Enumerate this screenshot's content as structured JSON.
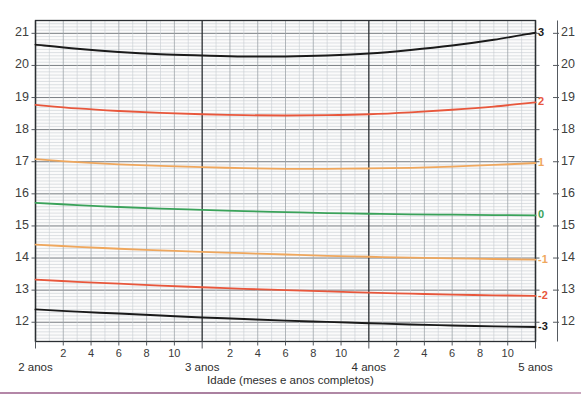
{
  "chart_data": {
    "type": "line",
    "title": "",
    "subtitle": "",
    "xlabel": "Idade (meses e anos completos)",
    "ylabel": "",
    "ylabel_right": "",
    "xlim": [
      24,
      60
    ],
    "ylim": [
      11.4,
      21.4
    ],
    "grid": true,
    "legend_position": "right-inline-labels",
    "x_unit": "months",
    "x_tick_labels_months": [
      "2",
      "4",
      "6",
      "8",
      "10"
    ],
    "x_year_labels": [
      "2 anos",
      "3 anos",
      "4 anos",
      "5 anos"
    ],
    "x_year_values": [
      24,
      36,
      48,
      60
    ],
    "y_tick_labels_left": [
      "21",
      "20",
      "19",
      "18",
      "17",
      "16",
      "15",
      "14",
      "13",
      "12"
    ],
    "y_tick_values_left": [
      21,
      20,
      19,
      18,
      17,
      16,
      15,
      14,
      13,
      12
    ],
    "y_tick_labels_right": [
      "21",
      "20",
      "19",
      "18",
      "17",
      "16",
      "15",
      "14",
      "13",
      "12"
    ],
    "y_tick_values_right": [
      21,
      20,
      19,
      18,
      17,
      16,
      15,
      14,
      13,
      12
    ],
    "z_axis_labels": [
      "3",
      "2",
      "1",
      "0",
      "-1",
      "-2",
      "-3"
    ],
    "x": [
      24,
      27,
      30,
      33,
      36,
      39,
      42,
      45,
      48,
      51,
      54,
      57,
      60
    ],
    "series": [
      {
        "name": "3",
        "z": 3,
        "color": "#1a1a1a",
        "end_label": "3",
        "values": [
          20.65,
          20.52,
          20.42,
          20.35,
          20.31,
          20.28,
          20.28,
          20.31,
          20.37,
          20.48,
          20.62,
          20.8,
          21.02
        ]
      },
      {
        "name": "2",
        "z": 2,
        "color": "#e8573c",
        "end_label": "2",
        "values": [
          18.77,
          18.66,
          18.58,
          18.52,
          18.48,
          18.45,
          18.44,
          18.45,
          18.48,
          18.54,
          18.62,
          18.72,
          18.85
        ]
      },
      {
        "name": "1",
        "z": 1,
        "color": "#efa75d",
        "end_label": "1",
        "values": [
          17.08,
          16.99,
          16.92,
          16.87,
          16.83,
          16.8,
          16.78,
          16.78,
          16.79,
          16.81,
          16.85,
          16.9,
          16.96
        ]
      },
      {
        "name": "0",
        "z": 0,
        "color": "#3aa25a",
        "end_label": "0",
        "values": [
          15.72,
          15.65,
          15.59,
          15.54,
          15.5,
          15.46,
          15.43,
          15.4,
          15.38,
          15.36,
          15.35,
          15.34,
          15.33
        ]
      },
      {
        "name": "-1",
        "z": -1,
        "color": "#efa75d",
        "end_label": "-1",
        "values": [
          14.42,
          14.35,
          14.29,
          14.24,
          14.19,
          14.15,
          14.11,
          14.07,
          14.04,
          14.01,
          13.99,
          13.97,
          13.95
        ]
      },
      {
        "name": "-2",
        "z": -2,
        "color": "#e8573c",
        "end_label": "-2",
        "values": [
          13.33,
          13.26,
          13.2,
          13.14,
          13.09,
          13.04,
          13.0,
          12.96,
          12.92,
          12.89,
          12.86,
          12.84,
          12.82
        ]
      },
      {
        "name": "-3",
        "z": -3,
        "color": "#1a1a1a",
        "end_label": "-3",
        "values": [
          12.4,
          12.33,
          12.27,
          12.21,
          12.15,
          12.1,
          12.05,
          12.01,
          11.97,
          11.93,
          11.9,
          11.87,
          11.85
        ]
      }
    ]
  },
  "axes": {
    "x_title": "Idade (meses e anos completos)",
    "year_markers": [
      {
        "label": "2 anos",
        "month": 24
      },
      {
        "label": "3 anos",
        "month": 36
      },
      {
        "label": "4 anos",
        "month": 48
      },
      {
        "label": "5 anos",
        "month": 60
      }
    ],
    "month_ticks": [
      {
        "label": "2",
        "month": 26
      },
      {
        "label": "4",
        "month": 28
      },
      {
        "label": "6",
        "month": 30
      },
      {
        "label": "8",
        "month": 32
      },
      {
        "label": "10",
        "month": 34
      },
      {
        "label": "2",
        "month": 38
      },
      {
        "label": "4",
        "month": 40
      },
      {
        "label": "6",
        "month": 42
      },
      {
        "label": "8",
        "month": 44
      },
      {
        "label": "10",
        "month": 46
      },
      {
        "label": "2",
        "month": 50
      },
      {
        "label": "4",
        "month": 52
      },
      {
        "label": "6",
        "month": 54
      },
      {
        "label": "8",
        "month": 56
      },
      {
        "label": "10",
        "month": 58
      }
    ],
    "left_ticks": [
      "21",
      "20",
      "19",
      "18",
      "17",
      "16",
      "15",
      "14",
      "13",
      "12"
    ],
    "right_ticks": [
      "21",
      "20",
      "19",
      "18",
      "17",
      "16",
      "15",
      "14",
      "13",
      "12"
    ]
  },
  "colors": {
    "z3": "#1a1a1a",
    "z2": "#e8573c",
    "z1": "#efa75d",
    "z0": "#3aa25a",
    "zm1": "#efa75d",
    "zm2": "#e8573c",
    "zm3": "#1a1a1a",
    "grid_minor": "#c8cdd2",
    "grid_major": "#6a6f75",
    "axis": "#555a60",
    "footer_rule": "#a87f9e",
    "plot_bg": "#fbfbfb"
  }
}
